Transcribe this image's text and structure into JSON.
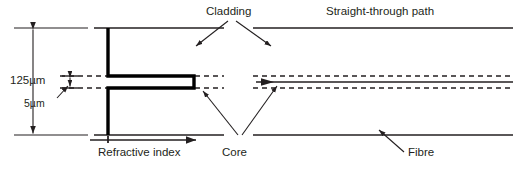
{
  "figure": {
    "stroke_color": "#231f20",
    "thick_stroke_color": "#000000",
    "background": "#ffffff"
  },
  "labels": {
    "cladding": "Cladding",
    "straight_through_path": "Straight-through path",
    "dim_cladding": "125µm",
    "dim_core": "5µm",
    "refractive_index": "Refractive index",
    "core": "Core",
    "fibre": "Fibre"
  },
  "dimensions": {
    "cladding_diameter_value": 125,
    "cladding_diameter_unit": "µm",
    "core_diameter_value": 5,
    "core_diameter_unit": "µm"
  },
  "geometry": {
    "cladding_top_y": 28,
    "cladding_bottom_y": 135,
    "core_top_y": 76,
    "core_bottom_y": 88,
    "core_center_y": 82,
    "profile_axis_x": 108,
    "profile_step_x": 194,
    "left_section_start_x": 94,
    "left_section_end_x": 224,
    "right_section_start_x": 253,
    "right_section_end_x": 513,
    "dim_line_x": 33
  }
}
